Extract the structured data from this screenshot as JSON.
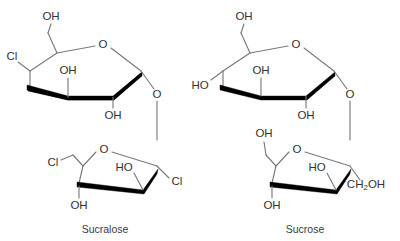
{
  "figure": {
    "background_color": "#ffffff",
    "bond_color": "#7a7a7a",
    "wedge_color": "#000000",
    "label_color": "#333333",
    "molecules": [
      {
        "name": "sucralose",
        "caption": "Sucralose",
        "rings": [
          {
            "type": "pyranose",
            "position": "top-left",
            "labels": [
              {
                "id": "c6-oh",
                "text": "OH",
                "role": "hydroxymethyl-terminus"
              },
              {
                "id": "ring-o",
                "text": "O",
                "role": "ring-oxygen"
              },
              {
                "id": "c4-cl",
                "text": "Cl",
                "role": "chloro-substituent"
              },
              {
                "id": "c3-oh",
                "text": "OH",
                "role": "hydroxyl"
              },
              {
                "id": "c2-oh",
                "text": "OH",
                "role": "hydroxyl"
              },
              {
                "id": "glycosidic-o",
                "text": "O",
                "role": "glycosidic-oxygen"
              }
            ]
          },
          {
            "type": "furanose",
            "position": "bottom-left",
            "labels": [
              {
                "id": "f-ring-o",
                "text": "O",
                "role": "ring-oxygen"
              },
              {
                "id": "f-c6-cl",
                "text": "Cl",
                "role": "chloromethyl-terminus"
              },
              {
                "id": "f-c3-oh",
                "text": "OH",
                "role": "hydroxyl"
              },
              {
                "id": "f-c4-ho",
                "text": "HO",
                "role": "hydroxyl"
              },
              {
                "id": "f-c1-cl",
                "text": "Cl",
                "role": "chloromethyl-terminus"
              }
            ]
          }
        ]
      },
      {
        "name": "sucrose",
        "caption": "Sucrose",
        "rings": [
          {
            "type": "pyranose",
            "position": "top-right",
            "labels": [
              {
                "id": "c6-oh",
                "text": "OH",
                "role": "hydroxymethyl-terminus"
              },
              {
                "id": "ring-o",
                "text": "O",
                "role": "ring-oxygen"
              },
              {
                "id": "c4-ho",
                "text": "HO",
                "role": "hydroxyl"
              },
              {
                "id": "c3-oh",
                "text": "OH",
                "role": "hydroxyl"
              },
              {
                "id": "c2-oh",
                "text": "OH",
                "role": "hydroxyl"
              },
              {
                "id": "glycosidic-o",
                "text": "O",
                "role": "glycosidic-oxygen"
              }
            ]
          },
          {
            "type": "furanose",
            "position": "bottom-right",
            "labels": [
              {
                "id": "f-ring-o",
                "text": "O",
                "role": "ring-oxygen"
              },
              {
                "id": "f-c6-oh",
                "text": "OH",
                "role": "hydroxymethyl-terminus"
              },
              {
                "id": "f-c3-oh",
                "text": "OH",
                "role": "hydroxyl"
              },
              {
                "id": "f-c4-ho",
                "text": "HO",
                "role": "hydroxyl"
              },
              {
                "id": "f-c1-ch2oh_main",
                "text": "CH",
                "role": "hydroxymethyl-group"
              },
              {
                "id": "f-c1-ch2oh_sub",
                "text": "2",
                "role": "subscript"
              },
              {
                "id": "f-c1-ch2oh_tail",
                "text": "OH",
                "role": "hydroxymethyl-group"
              }
            ]
          }
        ]
      }
    ]
  }
}
